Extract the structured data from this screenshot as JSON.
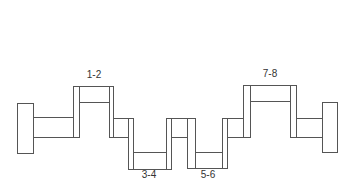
{
  "diagram": {
    "stroke_color": "#555555",
    "crankpin_labels": [
      {
        "label": "1-2",
        "x": 94,
        "y": 70
      },
      {
        "label": "3-4",
        "x": 149,
        "y": 172
      },
      {
        "label": "5-6",
        "x": 208,
        "y": 172
      },
      {
        "label": "7-8",
        "x": 270,
        "y": 69
      }
    ],
    "parts": [
      {
        "type": "flange",
        "name": "front-flange",
        "x": 17,
        "y": 103,
        "w": 16,
        "h": 50
      },
      {
        "type": "main-journal",
        "name": "journal-1",
        "x": 33,
        "y": 117,
        "w": 40,
        "h": 20
      },
      {
        "type": "web",
        "name": "web-1",
        "x": 73,
        "y": 86,
        "w": 6,
        "h": 51
      },
      {
        "type": "crankpin",
        "name": "pin-1-2",
        "x": 79,
        "y": 86,
        "w": 30,
        "h": 16
      },
      {
        "type": "web",
        "name": "web-2",
        "x": 109,
        "y": 86,
        "w": 4,
        "h": 51
      },
      {
        "type": "main-journal",
        "name": "journal-2",
        "x": 113,
        "y": 118,
        "w": 15,
        "h": 19
      },
      {
        "type": "web",
        "name": "web-3",
        "x": 128,
        "y": 118,
        "w": 5,
        "h": 51
      },
      {
        "type": "crankpin",
        "name": "pin-3-4",
        "x": 133,
        "y": 152,
        "w": 33,
        "h": 17
      },
      {
        "type": "web",
        "name": "web-4",
        "x": 166,
        "y": 118,
        "w": 5,
        "h": 51
      },
      {
        "type": "main-journal",
        "name": "journal-3",
        "x": 171,
        "y": 118,
        "w": 16,
        "h": 19
      },
      {
        "type": "web",
        "name": "web-5",
        "x": 187,
        "y": 118,
        "w": 8,
        "h": 50
      },
      {
        "type": "crankpin",
        "name": "pin-5-6",
        "x": 195,
        "y": 152,
        "w": 27,
        "h": 16
      },
      {
        "type": "web",
        "name": "web-6",
        "x": 222,
        "y": 118,
        "w": 5,
        "h": 50
      },
      {
        "type": "main-journal",
        "name": "journal-4",
        "x": 227,
        "y": 118,
        "w": 16,
        "h": 19
      },
      {
        "type": "web",
        "name": "web-7",
        "x": 243,
        "y": 85,
        "w": 7,
        "h": 52
      },
      {
        "type": "crankpin",
        "name": "pin-7-8",
        "x": 250,
        "y": 85,
        "w": 40,
        "h": 16
      },
      {
        "type": "web",
        "name": "web-8",
        "x": 290,
        "y": 85,
        "w": 6,
        "h": 52
      },
      {
        "type": "main-journal",
        "name": "journal-5",
        "x": 296,
        "y": 118,
        "w": 26,
        "h": 19
      },
      {
        "type": "flange",
        "name": "rear-flange",
        "x": 322,
        "y": 102,
        "w": 15,
        "h": 50
      }
    ]
  }
}
